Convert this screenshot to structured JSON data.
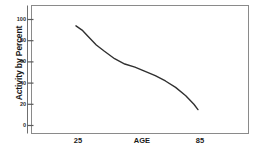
{
  "chart_data": {
    "type": "line",
    "title": "",
    "xlabel": "AGE",
    "ylabel": "Activity by Percent",
    "xlim": [
      20,
      90
    ],
    "ylim": [
      0,
      100
    ],
    "grid": false,
    "legend": null,
    "y_ticks": [
      "100",
      "80",
      "60",
      "40",
      "20",
      "0"
    ],
    "y_tick_values": [
      100,
      80,
      60,
      40,
      20,
      0
    ],
    "x_ticks": [
      "25",
      "85"
    ],
    "x_tick_values": [
      25,
      85
    ],
    "series": [
      {
        "name": "Activity",
        "x": [
          24,
          27,
          30,
          34,
          38,
          43,
          48,
          53,
          58,
          63,
          68,
          73,
          78,
          82,
          84
        ],
        "values": [
          94,
          90,
          84,
          76,
          70,
          63,
          58,
          55,
          51,
          47,
          42,
          36,
          28,
          20,
          15
        ]
      }
    ]
  },
  "axes": {
    "y_title": "Activity by Percent",
    "x_title": "AGE",
    "y_tick_labels": [
      "100",
      "80",
      "60",
      "40",
      "20",
      "0"
    ],
    "x_tick_labels": [
      "25",
      "85"
    ]
  },
  "style": {
    "line_color": "#303030",
    "frame_color": "#8a8a8a",
    "text_color": "#1a1a1a",
    "background": "#ffffff"
  }
}
